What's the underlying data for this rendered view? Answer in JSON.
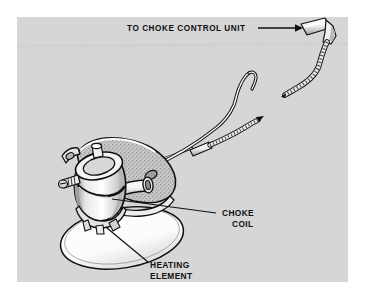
{
  "figure": {
    "background_color": "#ffffff",
    "panel_color": "#d6d6d6",
    "ink_color": "#111111",
    "highlight_color": "#ffffff",
    "shade_color": "#9a9a9a",
    "panel": {
      "x": 17,
      "y": 17,
      "width": 331,
      "height": 265
    }
  },
  "callouts": [
    {
      "id": "to-choke-control-unit",
      "text": "TO CHOKE CONTROL UNIT",
      "lines": [
        "TO CHOKE CONTROL UNIT"
      ],
      "anchor": "start",
      "x": 127,
      "y": 31,
      "leader": {
        "type": "arrow",
        "x1": 258,
        "y1": 28,
        "x2": 301,
        "y2": 28
      }
    },
    {
      "id": "choke-coil",
      "text": "CHOKE COIL",
      "lines": [
        "CHOKE",
        "COIL"
      ],
      "anchor": "start",
      "x": 222,
      "y": 216,
      "leader": {
        "type": "line",
        "x1": 216,
        "y1": 213,
        "x2": 112,
        "y2": 199
      }
    },
    {
      "id": "heating-element",
      "text": "HEATING ELEMENT",
      "lines": [
        "HEATING",
        "ELEMENT"
      ],
      "anchor": "start",
      "x": 150,
      "y": 268,
      "leader": {
        "type": "line",
        "x1": 146,
        "y1": 262,
        "x2": 108,
        "y2": 230
      }
    }
  ],
  "parts": [
    {
      "id": "choke-control-connector",
      "label": "choke control unit connector",
      "type": "cylindrical terminal"
    },
    {
      "id": "braided-lead-upper",
      "label": "braided electrical lead (upper)",
      "type": "wire"
    },
    {
      "id": "braided-lead-lower",
      "label": "braided electrical lead (lower)",
      "type": "wire"
    },
    {
      "id": "choke-linkage-rod",
      "label": "bent choke linkage rod",
      "type": "rod"
    },
    {
      "id": "mounting-bracket",
      "label": "stippled mounting bracket",
      "type": "bracket"
    },
    {
      "id": "coil-housing",
      "label": "cylindrical choke coil housing",
      "type": "housing"
    },
    {
      "id": "heating-element-disc",
      "label": "elliptical heating element disc",
      "type": "disc"
    }
  ]
}
